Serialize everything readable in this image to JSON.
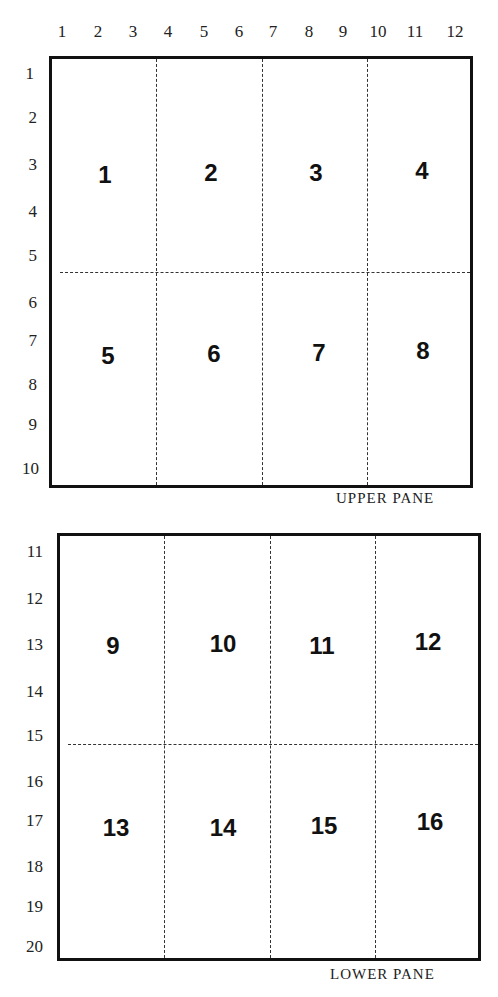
{
  "column_labels": [
    "1",
    "2",
    "3",
    "4",
    "5",
    "6",
    "7",
    "8",
    "9",
    "10",
    "11",
    "12"
  ],
  "row_labels": [
    "1",
    "2",
    "3",
    "4",
    "5",
    "6",
    "7",
    "8",
    "9",
    "10",
    "11",
    "12",
    "13",
    "14",
    "15",
    "16",
    "17",
    "18",
    "19",
    "20"
  ],
  "upper_pane": {
    "caption": "UPPER PANE",
    "cells": [
      "1",
      "2",
      "3",
      "4",
      "5",
      "6",
      "7",
      "8"
    ]
  },
  "lower_pane": {
    "caption": "LOWER PANE",
    "cells": [
      "9",
      "10",
      "11",
      "12",
      "13",
      "14",
      "15",
      "16"
    ]
  }
}
